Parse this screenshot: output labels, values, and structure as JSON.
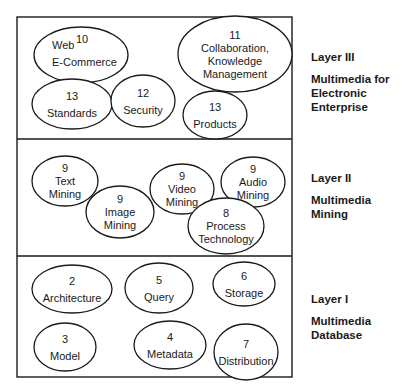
{
  "diagram": {
    "frame": {
      "x": 17,
      "y": 17,
      "w": 275,
      "h": 360
    },
    "dividers": [
      139,
      256
    ],
    "layers": [
      {
        "name": "Layer III",
        "description": "Multimedia for\nElectronic\nEnterprise",
        "label_top": 50,
        "topics": [
          {
            "id": "web-ecommerce",
            "number": "10",
            "lines": [
              "Web",
              "E-Commerce"
            ],
            "cx": 81,
            "cy": 55,
            "rx": 47,
            "ry": 28
          },
          {
            "id": "collaboration",
            "number": "11",
            "lines": [
              "Collaboration,",
              "Knowledge",
              "Management"
            ],
            "cx": 235,
            "cy": 54,
            "rx": 57,
            "ry": 38
          },
          {
            "id": "standards",
            "number": "13",
            "lines": [
              "Standards"
            ],
            "cx": 72,
            "cy": 104,
            "rx": 40,
            "ry": 25
          },
          {
            "id": "security",
            "number": "12",
            "lines": [
              "Security"
            ],
            "cx": 143,
            "cy": 101,
            "rx": 32,
            "ry": 26
          },
          {
            "id": "products",
            "number": "13",
            "lines": [
              "Products"
            ],
            "cx": 215,
            "cy": 115,
            "rx": 32,
            "ry": 24
          }
        ]
      },
      {
        "name": "Layer II",
        "description": "Multimedia\nMining",
        "label_top": 171,
        "topics": [
          {
            "id": "text-mining",
            "number": "9",
            "lines": [
              "Text",
              "Mining"
            ],
            "cx": 65,
            "cy": 181,
            "rx": 33,
            "ry": 25
          },
          {
            "id": "image-mining",
            "number": "9",
            "lines": [
              "Image",
              "Mining"
            ],
            "cx": 120,
            "cy": 212,
            "rx": 34,
            "ry": 26
          },
          {
            "id": "video-mining",
            "number": "9",
            "lines": [
              "Video",
              "Mining"
            ],
            "cx": 182,
            "cy": 189,
            "rx": 32,
            "ry": 25
          },
          {
            "id": "audio-mining",
            "number": "9",
            "lines": [
              "Audio",
              "Mining"
            ],
            "cx": 253,
            "cy": 182,
            "rx": 32,
            "ry": 25
          },
          {
            "id": "process-technology",
            "number": "8",
            "lines": [
              "Process",
              "Technology"
            ],
            "cx": 226,
            "cy": 226,
            "rx": 38,
            "ry": 28
          }
        ]
      },
      {
        "name": "Layer I",
        "description": "Multimedia\nDatabase",
        "label_top": 292,
        "topics": [
          {
            "id": "architecture",
            "number": "2",
            "lines": [
              "Architecture"
            ],
            "cx": 72,
            "cy": 289,
            "rx": 40,
            "ry": 24
          },
          {
            "id": "query",
            "number": "5",
            "lines": [
              "Query"
            ],
            "cx": 159,
            "cy": 288,
            "rx": 34,
            "ry": 25
          },
          {
            "id": "storage",
            "number": "6",
            "lines": [
              "Storage"
            ],
            "cx": 244,
            "cy": 284,
            "rx": 31,
            "ry": 22
          },
          {
            "id": "model",
            "number": "3",
            "lines": [
              "Model"
            ],
            "cx": 65,
            "cy": 347,
            "rx": 31,
            "ry": 24
          },
          {
            "id": "metadata",
            "number": "4",
            "lines": [
              "Metadata"
            ],
            "cx": 170,
            "cy": 345,
            "rx": 36,
            "ry": 24
          },
          {
            "id": "distribution",
            "number": "7",
            "lines": [
              "Distribution"
            ],
            "cx": 246,
            "cy": 352,
            "rx": 32,
            "ry": 28
          }
        ]
      }
    ]
  }
}
